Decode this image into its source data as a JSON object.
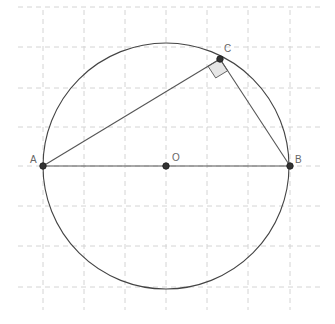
{
  "diagram": {
    "grid": {
      "spacing": 41,
      "color": "#d4d4d4",
      "x_lines": [
        43,
        84,
        125,
        166,
        207,
        248,
        290
      ],
      "y_lines": [
        7,
        47,
        88,
        166,
        206,
        246,
        287
      ]
    },
    "circle": {
      "cx": 166,
      "cy": 166,
      "r": 123,
      "stroke": "#444444"
    },
    "points": {
      "A": {
        "label": "A",
        "x": 43,
        "y": 166
      },
      "B": {
        "label": "B",
        "x": 290,
        "y": 166
      },
      "C": {
        "label": "C",
        "x": 220,
        "y": 59
      },
      "O": {
        "label": "O",
        "x": 166,
        "y": 166
      }
    },
    "segments": [
      [
        "A",
        "B"
      ],
      [
        "A",
        "C"
      ],
      [
        "B",
        "C"
      ]
    ],
    "right_angle_marker": {
      "at": "C",
      "fill": "#e6e6e6"
    }
  }
}
